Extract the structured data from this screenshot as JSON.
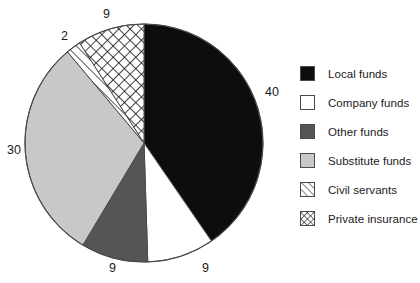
{
  "chart_data": {
    "type": "pie",
    "title": "",
    "subtitle": "",
    "xlabel": "",
    "ylabel": "",
    "legend_position": "right",
    "grid": false,
    "start_angle_deg": 0,
    "direction": "clockwise",
    "categories": [
      "Local funds",
      "Company funds",
      "Other funds",
      "Substitute funds",
      "Civil servants",
      "Private insurance"
    ],
    "values": [
      40,
      9,
      9,
      30,
      2,
      9
    ],
    "slices": [
      {
        "label": "Local funds",
        "value": 40,
        "value_text": "40",
        "fill": "#0d0d0d",
        "pattern": "solid"
      },
      {
        "label": "Company funds",
        "value": 9,
        "value_text": "9",
        "fill": "#ffffff",
        "pattern": "solid"
      },
      {
        "label": "Other funds",
        "value": 9,
        "value_text": "9",
        "fill": "#555555",
        "pattern": "solid"
      },
      {
        "label": "Substitute funds",
        "value": 30,
        "value_text": "30",
        "fill": "#c8c8c8",
        "pattern": "solid"
      },
      {
        "label": "Civil servants",
        "value": 2,
        "value_text": "2",
        "fill": "#ffffff",
        "pattern": "diagonal-stripes"
      },
      {
        "label": "Private insurance",
        "value": 9,
        "value_text": "9",
        "fill": "#ffffff",
        "pattern": "crosshatch"
      }
    ],
    "data_labels": [
      "40",
      "9",
      "9",
      "30",
      "2",
      "9"
    ]
  },
  "legend": {
    "items": [
      {
        "label": "Local funds",
        "swatch": "black-swatch"
      },
      {
        "label": "Company funds",
        "swatch": "white-swatch"
      },
      {
        "label": "Other funds",
        "swatch": "dark-gray-swatch"
      },
      {
        "label": "Substitute funds",
        "swatch": "light-gray-swatch"
      },
      {
        "label": "Civil servants",
        "swatch": "diagonal-stripe-swatch"
      },
      {
        "label": "Private insurance",
        "swatch": "crosshatch-swatch"
      }
    ]
  },
  "colors": {
    "local_funds": "#0d0d0d",
    "company_funds": "#ffffff",
    "other_funds": "#555555",
    "substitute_funds": "#c8c8c8",
    "outline": "#4a4a4a",
    "text": "#1a1a1a",
    "background": "#ffffff"
  },
  "labels": {
    "local_funds_value": "40",
    "company_funds_value": "9",
    "other_funds_value": "9",
    "substitute_funds_value": "30",
    "civil_servants_value": "2",
    "private_insurance_value": "9"
  }
}
